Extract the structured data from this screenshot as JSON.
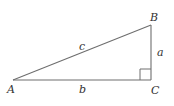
{
  "diagram": {
    "type": "right-triangle",
    "vertices": {
      "A": {
        "label": "A",
        "x": 13,
        "y": 80
      },
      "B": {
        "label": "B",
        "x": 151,
        "y": 25
      },
      "C": {
        "label": "C",
        "x": 151,
        "y": 80
      }
    },
    "sides": {
      "a": {
        "label": "a",
        "from": "B",
        "to": "C"
      },
      "b": {
        "label": "b",
        "from": "A",
        "to": "C"
      },
      "c": {
        "label": "c",
        "from": "A",
        "to": "B"
      }
    },
    "right_angle_at": "C",
    "colors": {
      "line": "#6e6e6e",
      "label": "#333333",
      "background": "#ffffff"
    }
  }
}
